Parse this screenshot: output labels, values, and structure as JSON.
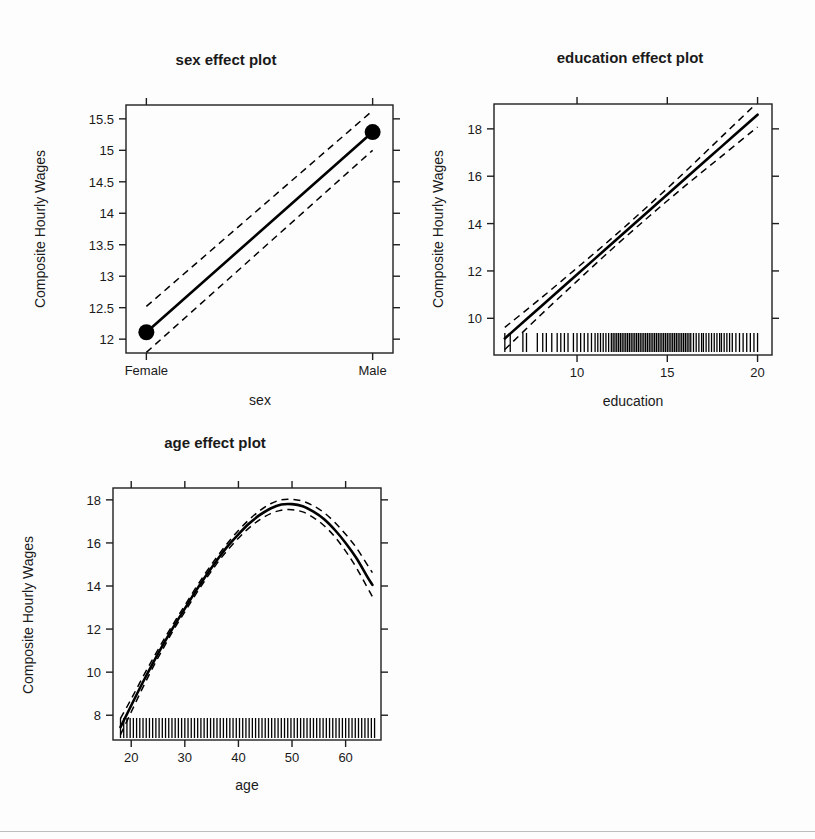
{
  "figure": {
    "background_color": "#fdfdfd",
    "foreground_color": "#000000",
    "width": 815,
    "height": 839,
    "panel_count": 3
  },
  "panels": {
    "sex": {
      "title": "sex effect plot",
      "xlabel": "sex",
      "ylabel": "Composite Hourly Wages"
    },
    "education": {
      "title": "education effect plot",
      "xlabel": "education",
      "ylabel": "Composite Hourly Wages"
    },
    "age": {
      "title": "age effect plot",
      "xlabel": "age",
      "ylabel": "Composite Hourly Wages"
    }
  },
  "chart_data": [
    {
      "id": "sex",
      "type": "line",
      "title": "sex effect plot",
      "xlabel": "sex",
      "ylabel": "Composite Hourly Wages",
      "grid": false,
      "legend": "none",
      "categorical_x": true,
      "categories": [
        "Female",
        "Male"
      ],
      "xtick_labels": [
        "Female",
        "Male"
      ],
      "xtick_values": [
        0,
        1
      ],
      "xlim": [
        -0.09,
        1.09
      ],
      "ytick_labels": [
        "12",
        "12.5",
        "13",
        "13.5",
        "14",
        "14.5",
        "15",
        "15.5"
      ],
      "ytick_values": [
        12,
        12.5,
        13,
        13.5,
        14,
        14.5,
        15,
        15.5
      ],
      "ylim": [
        11.78,
        15.72
      ],
      "series": [
        {
          "name": "fit",
          "style": "solid",
          "x": [
            0,
            1
          ],
          "values": [
            12.11,
            15.29
          ]
        },
        {
          "name": "upper confidence limit",
          "style": "dashed",
          "x": [
            0,
            1
          ],
          "values": [
            12.52,
            15.63
          ]
        },
        {
          "name": "lower confidence limit",
          "style": "dashed",
          "x": [
            0,
            1
          ],
          "values": [
            11.79,
            15.0
          ]
        }
      ],
      "points": [
        {
          "x": 0,
          "y": 12.11,
          "label": "Female"
        },
        {
          "x": 1,
          "y": 15.29,
          "label": "Male"
        }
      ],
      "rug": []
    },
    {
      "id": "education",
      "type": "line",
      "title": "education effect plot",
      "xlabel": "education",
      "ylabel": "Composite Hourly Wages",
      "grid": false,
      "legend": "none",
      "categorical_x": false,
      "xtick_labels": [
        "10",
        "15",
        "20"
      ],
      "xtick_values": [
        10,
        15,
        20
      ],
      "xlim": [
        5.4,
        20.8
      ],
      "ytick_labels": [
        "10",
        "12",
        "14",
        "16",
        "18"
      ],
      "ytick_values": [
        10,
        12,
        14,
        16,
        18
      ],
      "ylim": [
        8.45,
        19.05
      ],
      "series": [
        {
          "name": "fit",
          "style": "solid",
          "x": [
            6.0,
            8.0,
            10.0,
            12.0,
            14.0,
            16.0,
            18.0,
            20.0
          ],
          "values": [
            9.15,
            10.5,
            11.85,
            13.2,
            14.55,
            15.9,
            17.25,
            18.6
          ]
        },
        {
          "name": "upper confidence limit",
          "style": "dashed",
          "x": [
            6.0,
            8.0,
            10.0,
            12.0,
            14.0,
            16.0,
            18.0,
            20.0
          ],
          "values": [
            9.62,
            10.85,
            12.13,
            13.43,
            14.79,
            16.2,
            17.66,
            19.12
          ]
        },
        {
          "name": "lower confidence limit",
          "style": "dashed",
          "x": [
            6.0,
            8.0,
            10.0,
            12.0,
            14.0,
            16.0,
            18.0,
            20.0
          ],
          "values": [
            8.68,
            10.15,
            11.57,
            12.97,
            14.31,
            15.6,
            16.84,
            18.08
          ]
        }
      ],
      "points": [],
      "rug": [
        6.0,
        6.3,
        7.0,
        7.2,
        7.8,
        8.1,
        8.3,
        8.6,
        8.9,
        9.1,
        9.3,
        9.5,
        9.8,
        10.0,
        10.2,
        10.4,
        10.6,
        10.8,
        11.0,
        11.15,
        11.3,
        11.45,
        11.6,
        11.75,
        11.9,
        12.0,
        12.1,
        12.2,
        12.3,
        12.4,
        12.5,
        12.6,
        12.7,
        12.8,
        12.9,
        13.0,
        13.1,
        13.2,
        13.3,
        13.4,
        13.5,
        13.6,
        13.7,
        13.8,
        13.9,
        14.0,
        14.1,
        14.2,
        14.3,
        14.4,
        14.5,
        14.6,
        14.7,
        14.8,
        14.9,
        15.0,
        15.1,
        15.2,
        15.3,
        15.4,
        15.5,
        15.6,
        15.7,
        15.8,
        15.9,
        16.0,
        16.1,
        16.2,
        16.3,
        16.45,
        16.6,
        16.75,
        16.9,
        17.0,
        17.15,
        17.3,
        17.45,
        17.6,
        17.75,
        17.9,
        18.0,
        18.15,
        18.3,
        18.45,
        18.6,
        18.8,
        19.0,
        19.2,
        19.4,
        19.6,
        19.8,
        20.0
      ]
    },
    {
      "id": "age",
      "type": "line",
      "title": "age effect plot",
      "xlabel": "age",
      "ylabel": "Composite Hourly Wages",
      "grid": false,
      "legend": "none",
      "categorical_x": false,
      "xtick_labels": [
        "20",
        "30",
        "40",
        "50",
        "60"
      ],
      "xtick_values": [
        20,
        30,
        40,
        50,
        60
      ],
      "xlim": [
        16.6,
        66.6
      ],
      "ytick_labels": [
        "8",
        "10",
        "12",
        "14",
        "16",
        "18"
      ],
      "ytick_values": [
        8,
        10,
        12,
        14,
        16,
        18
      ],
      "ylim": [
        6.85,
        18.55
      ],
      "peak": {
        "x": 49.5,
        "y": 17.8
      },
      "series": [
        {
          "name": "fit",
          "style": "solid",
          "x": [
            18,
            20,
            22,
            24,
            26,
            28,
            30,
            32,
            34,
            36,
            38,
            40,
            42,
            44,
            46,
            48,
            50,
            52,
            54,
            56,
            58,
            60,
            62,
            64,
            65
          ],
          "values": [
            7.45,
            8.45,
            9.45,
            10.4,
            11.3,
            12.15,
            12.95,
            13.75,
            14.5,
            15.2,
            15.85,
            16.4,
            16.9,
            17.3,
            17.6,
            17.78,
            17.8,
            17.7,
            17.45,
            17.1,
            16.6,
            16.0,
            15.3,
            14.45,
            14.05
          ]
        },
        {
          "name": "upper confidence limit",
          "style": "dashed",
          "x": [
            18,
            20,
            22,
            24,
            26,
            28,
            30,
            32,
            34,
            36,
            38,
            40,
            42,
            44,
            46,
            48,
            50,
            52,
            54,
            56,
            58,
            60,
            62,
            64,
            65
          ],
          "values": [
            7.85,
            8.75,
            9.7,
            10.6,
            11.48,
            12.3,
            13.1,
            13.9,
            14.65,
            15.35,
            16.0,
            16.58,
            17.08,
            17.5,
            17.82,
            18.0,
            18.02,
            17.94,
            17.72,
            17.4,
            16.95,
            16.4,
            15.78,
            15.0,
            14.62
          ]
        },
        {
          "name": "lower confidence limit",
          "style": "dashed",
          "x": [
            18,
            20,
            22,
            24,
            26,
            28,
            30,
            32,
            34,
            36,
            38,
            40,
            42,
            44,
            46,
            48,
            50,
            52,
            54,
            56,
            58,
            60,
            62,
            64,
            65
          ],
          "values": [
            7.1,
            8.15,
            9.2,
            10.2,
            11.12,
            12.0,
            12.8,
            13.6,
            14.35,
            15.05,
            15.68,
            16.22,
            16.7,
            17.08,
            17.36,
            17.52,
            17.54,
            17.44,
            17.18,
            16.8,
            16.28,
            15.62,
            14.85,
            13.95,
            13.5
          ]
        }
      ],
      "points": [],
      "rug": [
        18,
        18.6,
        19.2,
        19.8,
        20.4,
        21.0,
        21.6,
        22.2,
        22.8,
        23.4,
        24.0,
        24.6,
        25.2,
        25.8,
        26.4,
        27.0,
        27.6,
        28.2,
        28.8,
        29.4,
        30.0,
        30.6,
        31.2,
        31.8,
        32.4,
        33.0,
        33.6,
        34.2,
        34.8,
        35.4,
        36.0,
        36.6,
        37.2,
        37.8,
        38.4,
        39.0,
        39.6,
        40.2,
        40.8,
        41.4,
        42.0,
        42.6,
        43.2,
        43.8,
        44.4,
        45.0,
        45.6,
        46.2,
        46.8,
        47.4,
        48.0,
        48.6,
        49.2,
        49.8,
        50.4,
        51.0,
        51.6,
        52.2,
        52.8,
        53.4,
        54.0,
        54.6,
        55.2,
        55.8,
        56.4,
        57.0,
        57.6,
        58.2,
        58.8,
        59.4,
        60.0,
        60.6,
        61.2,
        61.8,
        62.4,
        63.0,
        63.6,
        64.2,
        64.8,
        65.4
      ]
    }
  ]
}
